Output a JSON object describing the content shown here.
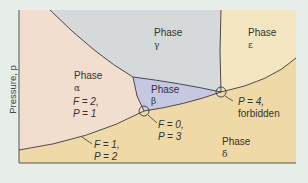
{
  "axis": {
    "ylabel": "Pressure, p"
  },
  "colors": {
    "background": "#e7ede9",
    "alpha": "#f2decf",
    "gamma": "#d6d9d9",
    "beta": "#c6c8e1",
    "epsilon": "#f5e6c2",
    "delta": "#efd9a6",
    "line": "#3a3a3a"
  },
  "phases": {
    "alpha": {
      "name": "Phase",
      "symbol": "α",
      "F": "F = 2,",
      "P": "P = 1"
    },
    "gamma": {
      "name": "Phase",
      "symbol": "γ"
    },
    "beta": {
      "name": "Phase",
      "symbol": "β"
    },
    "epsilon": {
      "name": "Phase",
      "symbol": "ε"
    },
    "delta": {
      "name": "Phase",
      "symbol": "δ"
    }
  },
  "annotations": {
    "boundary": {
      "F": "F = 1,",
      "P": "P = 2"
    },
    "triple_point": {
      "F": "F = 0,",
      "P": "P = 3"
    },
    "quadruple_point": {
      "P": "P = 4,",
      "note": "forbidden"
    }
  }
}
